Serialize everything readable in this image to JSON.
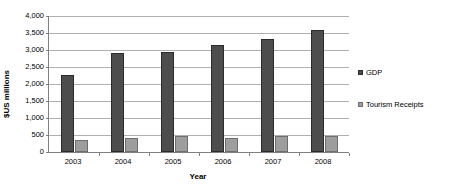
{
  "chart_data": {
    "type": "bar",
    "title": "",
    "xlabel": "Year",
    "ylabel": "$US millions",
    "categories": [
      "2003",
      "2004",
      "2005",
      "2006",
      "2007",
      "2008"
    ],
    "series": [
      {
        "name": "GDP",
        "color": "#4d4d4d",
        "values": [
          2270,
          2900,
          2940,
          3140,
          3330,
          3580
        ]
      },
      {
        "name": "Tourism Receipts",
        "color": "#9e9e9e",
        "values": [
          355,
          420,
          465,
          410,
          470,
          480
        ]
      }
    ],
    "ylim": [
      0,
      4000
    ],
    "ytick_values": [
      0,
      500,
      1000,
      1500,
      2000,
      2500,
      3000,
      3500,
      4000
    ],
    "ytick_labels": [
      "0",
      "500",
      "1,000",
      "1,500",
      "2,000",
      "2,500",
      "3,000",
      "3,500",
      "4,000"
    ],
    "grid": true,
    "legend_position": "right"
  }
}
